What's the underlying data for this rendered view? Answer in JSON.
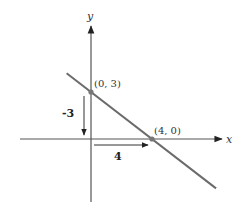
{
  "chart_data": {
    "type": "line",
    "title": "",
    "xlabel": "x",
    "ylabel": "y",
    "xlim": [
      -4.8,
      7.9
    ],
    "ylim": [
      -4.1,
      5.1
    ],
    "grid": false,
    "series": [
      {
        "name": "line",
        "x": [
          -1.6,
          8.2
        ],
        "y": [
          4.2,
          -3.15
        ],
        "color": "#6b6b6b"
      }
    ],
    "points": [
      {
        "x": 0,
        "y": 3,
        "label": "(0, 3)"
      },
      {
        "x": 4,
        "y": 0,
        "label": "(4, 0)"
      }
    ],
    "annotations": [
      {
        "type": "rise-arrow",
        "label": "-3",
        "from": [
          0,
          3
        ],
        "to": [
          0,
          0
        ]
      },
      {
        "type": "run-arrow",
        "label": "4",
        "from": [
          0,
          0
        ],
        "to": [
          4,
          0
        ]
      }
    ]
  }
}
